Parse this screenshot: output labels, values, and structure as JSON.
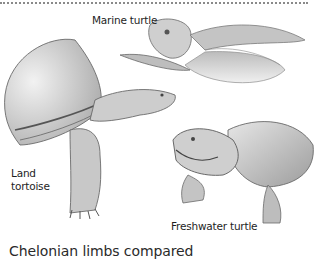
{
  "figure": {
    "caption": "Chelonian limbs compared",
    "labels": {
      "marine": "Marine turtle",
      "land_line1": "Land",
      "land_line2": "tortoise",
      "freshwater": "Freshwater turtle"
    },
    "illustrations": [
      {
        "name": "marine-turtle",
        "style": "pencil-sketch"
      },
      {
        "name": "land-tortoise",
        "style": "pencil-sketch"
      },
      {
        "name": "freshwater-turtle",
        "style": "pencil-sketch"
      }
    ],
    "colors": {
      "rule": "#8a8a8a",
      "text": "#1e1e1e",
      "sketch_dark": "#5a5a5a",
      "sketch_mid": "#9a9a9a",
      "sketch_light": "#d6d6d6"
    }
  }
}
